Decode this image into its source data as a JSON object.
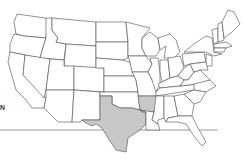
{
  "map": {
    "title": "",
    "region": "Contiguous United States",
    "highlight_color": "#c8c8c8",
    "outline_color": "#4a4a4a",
    "highlighted_states": [
      "Texas",
      "Arkansas"
    ],
    "edge_label": "N"
  }
}
